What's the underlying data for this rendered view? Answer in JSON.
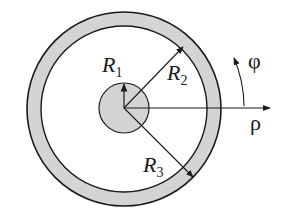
{
  "diagram": {
    "labels": {
      "r1": {
        "main": "R",
        "sub": "1"
      },
      "r2": {
        "main": "R",
        "sub": "2"
      },
      "r3": {
        "main": "R",
        "sub": "3"
      },
      "phi": "φ",
      "rho": "ρ"
    },
    "colors": {
      "stroke": "#1a1a1a",
      "fill": "#d4d4d4",
      "background": "#ffffff"
    }
  }
}
